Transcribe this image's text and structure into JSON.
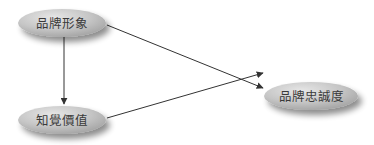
{
  "diagram": {
    "nodes": [
      {
        "id": "brand_image",
        "label": "品牌形象"
      },
      {
        "id": "perceived_value",
        "label": "知覺價值"
      },
      {
        "id": "brand_loyalty",
        "label": "品牌忠誠度"
      }
    ],
    "edges": [
      {
        "from": "brand_image",
        "to": "perceived_value"
      },
      {
        "from": "brand_image",
        "to": "brand_loyalty"
      },
      {
        "from": "perceived_value",
        "to": "brand_loyalty"
      }
    ],
    "colors": {
      "node_fill": "#c4c4c4",
      "node_highlight": "#e2e2e2",
      "edge": "#333333",
      "text": "#3a3a3a"
    }
  }
}
